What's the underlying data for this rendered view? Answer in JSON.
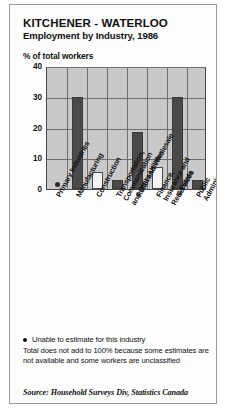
{
  "header": {
    "title": "KITCHENER - WATERLOO",
    "subtitle": "Employment by Industry, 1986"
  },
  "notes": {
    "footnote_marker": "dot-marker",
    "footnote1": "Unable to estimate for this industry",
    "footnote2": "Total does not add to 100% because some estimates are not available and some workers are unclassified",
    "source": "Source: Household Surveys Div, Statistics Canada"
  },
  "colors": {
    "panel": "#c9c9c9",
    "grid": "#6f6f6f",
    "bar_dark": "#4a4a4a",
    "bar_light": "#f2f2f2",
    "bar_outline": "#4a4a4a",
    "frame": "#9a9a9a",
    "text": "#111111"
  },
  "chart_data": {
    "type": "bar",
    "title": "KITCHENER - WATERLOO",
    "subtitle": "Employment by Industry, 1986",
    "xlabel": "",
    "ylabel": "% of total workers",
    "ylim": [
      0,
      40
    ],
    "yticks": [
      0,
      10,
      20,
      30,
      40
    ],
    "ytick_labels": [
      "0",
      "10",
      "20",
      "30",
      "40"
    ],
    "grid": true,
    "legend": "none",
    "categories": [
      "Primary Industries",
      "Manufacturing",
      "Construction",
      "Transportation, Communication and Other Utilities",
      "Retail and Wholesale",
      "Finance, Insurance and Real Estate",
      "Services",
      "Public Administration"
    ],
    "values": [
      null,
      30,
      5.5,
      3,
      18.5,
      7,
      30,
      3
    ],
    "bar_styles": [
      "marker",
      "dark",
      "light",
      "dark",
      "dark",
      "light",
      "dark",
      "dark"
    ],
    "annotations": [
      {
        "category": "Primary Industries",
        "marker": "dot",
        "note": "Unable to estimate for this industry"
      }
    ]
  },
  "axis_labels": [
    {
      "text": "Primary Industries"
    },
    {
      "text": "Manufacturing"
    },
    {
      "text": "Construction"
    },
    {
      "text": "Transportation, Communication\nand Other Utilities"
    },
    {
      "text": "Retail and Wholesale"
    },
    {
      "text": "Finance, Insurance and Real Estate"
    },
    {
      "text": "Services"
    },
    {
      "text": "Public Administration"
    }
  ]
}
